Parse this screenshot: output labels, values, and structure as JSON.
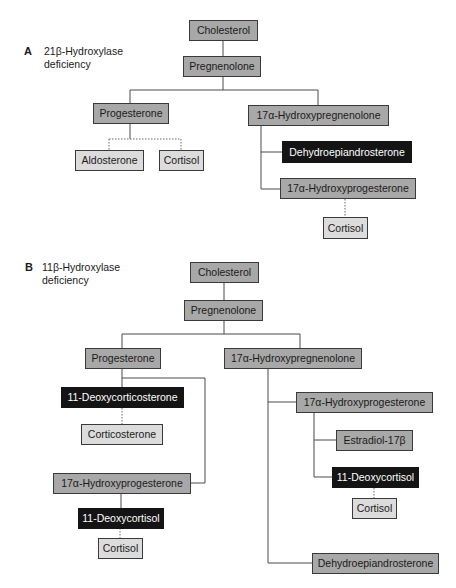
{
  "panels": [
    {
      "letter": "A",
      "title_line1": "21β-Hydroxylase",
      "title_line2": "deficiency",
      "nodes": {
        "cholesterol": "Cholesterol",
        "pregnenolone": "Pregnenolone",
        "progesterone": "Progesterone",
        "aldosterone": "Aldosterone",
        "cortisol_left": "Cortisol",
        "hydroxypregnenolone": "17α-Hydroxypregnenolone",
        "dhea": "Dehydroepiandrosterone",
        "hydroxyprogesterone": "17α-Hydroxyprogesterone",
        "cortisol_right": "Cortisol"
      }
    },
    {
      "letter": "B",
      "title_line1": "11β-Hydroxylase",
      "title_line2": "deficiency",
      "nodes": {
        "cholesterol": "Cholesterol",
        "pregnenolone": "Pregnenolone",
        "progesterone": "Progesterone",
        "deoxycorticosterone": "11-Deoxycorticosterone",
        "corticosterone": "Corticosterone",
        "hydroxyprogesterone_left": "17α-Hydroxyprogesterone",
        "deoxycortisol_left": "11-Deoxycortisol",
        "cortisol_left": "Cortisol",
        "hydroxypregnenolone": "17α-Hydroxypregnenolone",
        "hydroxyprogesterone_right": "17α-Hydroxyprogesterone",
        "estradiol": "Estradiol-17β",
        "deoxycortisol_right": "11-Deoxycortisol",
        "cortisol_right": "Cortisol",
        "dhea": "Dehydroepiandrosterone"
      }
    }
  ],
  "colors": {
    "precursor_fill": "#a8a8a8",
    "product_fill": "#dcdcdc",
    "accumulated_fill": "#141414",
    "line": "#4a4a4a"
  }
}
